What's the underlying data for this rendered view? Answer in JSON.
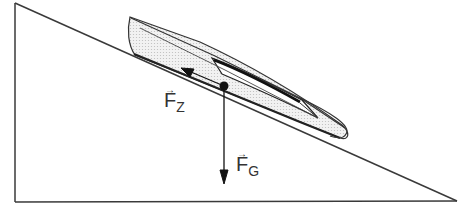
{
  "diagram": {
    "colors": {
      "line": "#333333",
      "hull_fill": "#e4e4e4",
      "background": "#ffffff"
    },
    "incline": {
      "apex": [
        15,
        3
      ],
      "base_left": [
        15,
        202
      ],
      "base_right": [
        457,
        201
      ]
    },
    "forces": [
      {
        "id": "fz",
        "symbol": "F",
        "subscript": "Z",
        "vector_mark": "→",
        "direction": "up-slope"
      },
      {
        "id": "fg",
        "symbol": "F",
        "subscript": "G",
        "vector_mark": "→",
        "direction": "down"
      }
    ],
    "center_of_mass": [
      224,
      86
    ]
  }
}
